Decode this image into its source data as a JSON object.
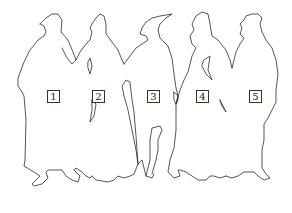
{
  "diagram": {
    "stroke_color": "#2a2a2a",
    "background_color": "#ffffff",
    "figures": [
      {
        "label": "1"
      },
      {
        "label": "2"
      },
      {
        "label": "3"
      },
      {
        "label": "4"
      },
      {
        "label": "5"
      }
    ]
  }
}
